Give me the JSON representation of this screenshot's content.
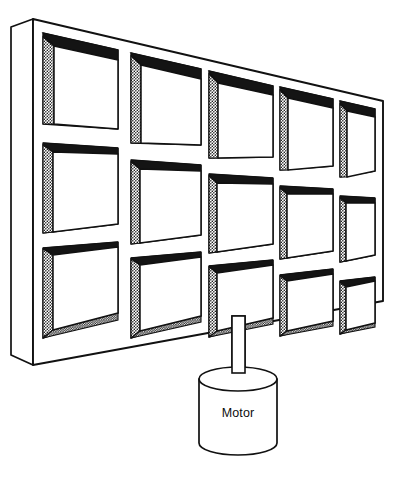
{
  "diagram": {
    "background_color": "#ffffff",
    "stroke_color": "#111111",
    "fill_color": "#ffffff",
    "shadow_dark_color": "#141414",
    "stipple_color": "#1a1a1a"
  },
  "panel": {
    "name": "perforated-panel",
    "rows": 3,
    "columns": 5,
    "cell_count": 15,
    "outline": {
      "front_top_left": [
        33,
        19
      ],
      "front_top_right": [
        383,
        101
      ],
      "front_bottom_right": [
        383,
        301
      ],
      "front_bottom_left": [
        33,
        365
      ],
      "side_top_left": [
        11,
        27
      ],
      "side_bottom_left": [
        11,
        355
      ]
    },
    "cells": [
      {
        "row": 0,
        "col": 0,
        "top_face": "dark",
        "left_face": "stipple",
        "bottom_face": "none"
      },
      {
        "row": 0,
        "col": 1,
        "top_face": "dark",
        "left_face": "stipple",
        "bottom_face": "none"
      },
      {
        "row": 0,
        "col": 2,
        "top_face": "dark",
        "left_face": "stipple",
        "bottom_face": "none"
      },
      {
        "row": 0,
        "col": 3,
        "top_face": "dark",
        "left_face": "stipple",
        "bottom_face": "none"
      },
      {
        "row": 0,
        "col": 4,
        "top_face": "dark",
        "left_face": "stipple",
        "bottom_face": "none"
      },
      {
        "row": 1,
        "col": 0,
        "top_face": "dark-thin",
        "left_face": "stipple",
        "bottom_face": "none"
      },
      {
        "row": 1,
        "col": 1,
        "top_face": "dark-thin",
        "left_face": "stipple",
        "bottom_face": "none"
      },
      {
        "row": 1,
        "col": 2,
        "top_face": "dark-thin",
        "left_face": "stipple",
        "bottom_face": "none"
      },
      {
        "row": 1,
        "col": 3,
        "top_face": "dark-thin",
        "left_face": "stipple",
        "bottom_face": "none"
      },
      {
        "row": 1,
        "col": 4,
        "top_face": "dark-thin",
        "left_face": "stipple",
        "bottom_face": "none"
      },
      {
        "row": 2,
        "col": 0,
        "top_face": "dark-thin",
        "left_face": "stipple",
        "bottom_face": "stipple"
      },
      {
        "row": 2,
        "col": 1,
        "top_face": "dark-thin",
        "left_face": "stipple",
        "bottom_face": "stipple"
      },
      {
        "row": 2,
        "col": 2,
        "top_face": "dark-thin",
        "left_face": "stipple",
        "bottom_face": "stipple"
      },
      {
        "row": 2,
        "col": 3,
        "top_face": "dark-thin",
        "left_face": "stipple",
        "bottom_face": "stipple"
      },
      {
        "row": 2,
        "col": 4,
        "top_face": "dark-thin",
        "left_face": "stipple",
        "bottom_face": "stipple"
      }
    ]
  },
  "shaft": {
    "name": "drive-shaft",
    "left_x": 232,
    "right_x": 245,
    "top_y": 318,
    "bottom_y": 381
  },
  "motor": {
    "name": "motor-cylinder",
    "label": "Motor",
    "center_x": 238,
    "top_ellipse_cy": 379,
    "rx": 39,
    "ry": 12,
    "body_bottom_y": 455,
    "label_x": 238,
    "label_y": 414
  }
}
